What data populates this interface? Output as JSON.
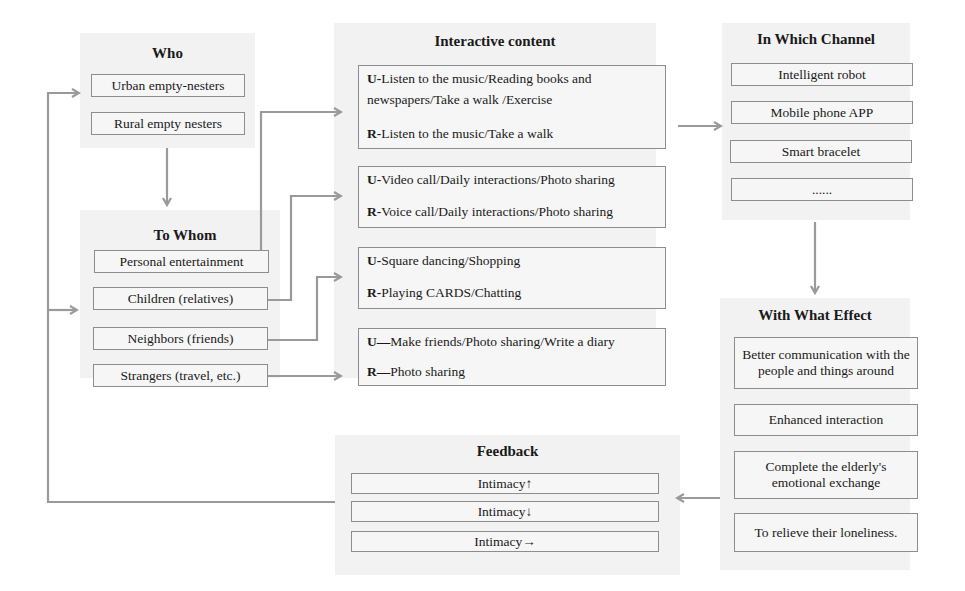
{
  "diagram": {
    "colors": {
      "panel_bg": "#f2f2f2",
      "box_border": "#8d8d8d",
      "arrow": "#9a9a9a"
    },
    "who": {
      "title": "Who",
      "items": [
        "Urban empty-nesters",
        "Rural empty nesters"
      ]
    },
    "to_whom": {
      "title": "To Whom",
      "items": [
        "Personal entertainment",
        "Children (relatives)",
        "Neighbors (friends)",
        "Strangers (travel, etc.)"
      ]
    },
    "interactive_content": {
      "title": "Interactive content",
      "groups": [
        {
          "u_prefix": "U",
          "u_sep": "-",
          "u_text_1": "Listen to the music/Reading books and",
          "u_text_2": "newspapers/Take a walk /Exercise",
          "r_prefix": "R",
          "r_sep": "-",
          "r_text": "Listen to the music/Take a walk"
        },
        {
          "u_prefix": "U",
          "u_sep": "-",
          "u_text_1": "Video call/Daily interactions/Photo sharing",
          "r_prefix": "R",
          "r_sep": "-",
          "r_text": "Voice call/Daily interactions/Photo sharing"
        },
        {
          "u_prefix": "U",
          "u_sep": "-",
          "u_text_1": "Square dancing/Shopping",
          "r_prefix": "R",
          "r_sep": "-",
          "r_text": "Playing CARDS/Chatting"
        },
        {
          "u_prefix": "U",
          "u_sep": "—",
          "u_text_1": "Make friends/Photo sharing/Write a diary",
          "r_prefix": "R",
          "r_sep": "—",
          "r_text": "Photo sharing"
        }
      ]
    },
    "in_which_channel": {
      "title": "In Which Channel",
      "items": [
        "Intelligent robot",
        "Mobile phone APP",
        "Smart bracelet",
        "......"
      ]
    },
    "with_what_effect": {
      "title": "With What Effect",
      "items": [
        "Better communication with the people and things around",
        "Enhanced interaction",
        "Complete the elderly's emotional exchange",
        "To relieve their loneliness."
      ]
    },
    "feedback": {
      "title": "Feedback",
      "items": [
        "Intimacy↑",
        "Intimacy↓",
        "Intimacy→"
      ]
    }
  }
}
